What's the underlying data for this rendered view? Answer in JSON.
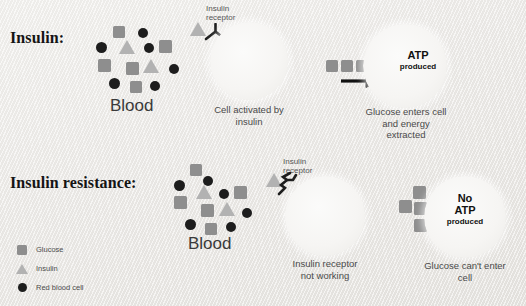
{
  "figure": {
    "title_row1": "Insulin:",
    "title_row2": "Insulin resistance:"
  },
  "rows": [
    {
      "heading": "Insulin:",
      "blood_label": "Blood",
      "receptor_label": "Insulin\nreceptor",
      "cell1_caption": "Cell activated by\ninsulin",
      "cell2_caption": "Glucose enters cell\nand energy\nextracted",
      "atp_main": "ATP",
      "atp_sub": "produced",
      "arrow": "right-arrow"
    },
    {
      "heading": "Insulin resistance:",
      "blood_label": "Blood",
      "receptor_label": "Insulin\nreceptor",
      "cell1_caption": "Insulin receptor\nnot working",
      "cell2_caption": "Glucose can't enter\ncell",
      "atp_main": "No\nATP",
      "atp_sub": "produced"
    }
  ],
  "legend": {
    "items": [
      {
        "label": "Glucose",
        "shape": "square",
        "color": "#8e8e8e"
      },
      {
        "label": "Insulin",
        "shape": "triangle",
        "color": "#b2b2b2"
      },
      {
        "label": "Red blood cell",
        "shape": "circle",
        "color": "#1d1d1d"
      }
    ]
  },
  "colors": {
    "background": "#eceae7",
    "glucose": "#8e8e8e",
    "insulin": "#b2b2b2",
    "red_blood_cell": "#1d1d1d",
    "cell_fill": "#f6f5f3",
    "text": "#4a4a4a",
    "heading": "#141414"
  }
}
